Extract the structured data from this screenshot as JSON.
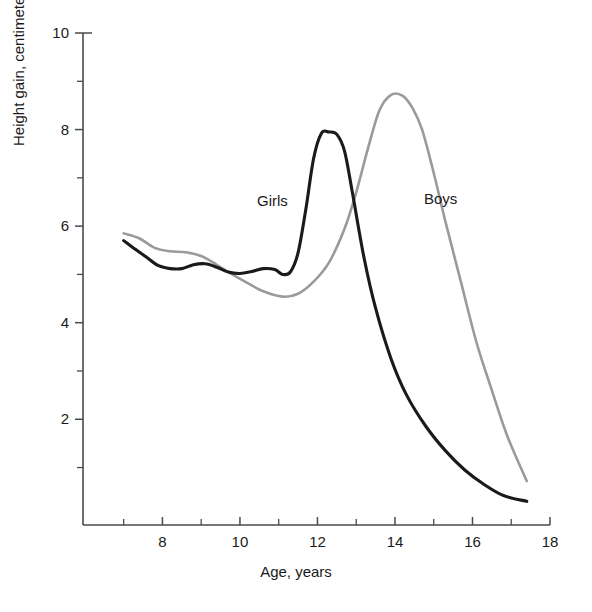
{
  "chart_data": {
    "type": "line",
    "title": "",
    "subtitle": "",
    "xlabel": "Age, years",
    "ylabel": "Height gain, centimeters per year",
    "xlim": [
      5.95,
      18.0
    ],
    "ylim": [
      -0.19,
      10.0
    ],
    "grid": false,
    "legend_position": "inline-annotation",
    "x_major_ticks": [
      8,
      10,
      12,
      14,
      16,
      18
    ],
    "x_minor_ticks": [
      7,
      9,
      11,
      13,
      15,
      17
    ],
    "x_tick_labels": [
      "8",
      "10",
      "12",
      "14",
      "16",
      "18"
    ],
    "y_major_ticks": [
      2,
      4,
      6,
      8,
      10
    ],
    "y_minor_ticks": [
      1,
      3,
      5,
      7,
      9
    ],
    "y_tick_labels": [
      "2",
      "4",
      "6",
      "8",
      "10"
    ],
    "annotations": [
      {
        "text": "Girls",
        "x": 12.5,
        "y": 6.6
      },
      {
        "text": "Boys",
        "x": 14.85,
        "y": 6.65
      }
    ],
    "series": [
      {
        "name": "Girls",
        "color": "#1a1a1a",
        "x": [
          7.0,
          7.3,
          7.6,
          7.9,
          8.2,
          8.5,
          8.8,
          9.1,
          9.4,
          9.7,
          10.0,
          10.3,
          10.6,
          10.9,
          11.1,
          11.3,
          11.5,
          11.7,
          11.9,
          12.1,
          12.3,
          12.5,
          12.7,
          12.9,
          13.2,
          13.5,
          13.9,
          14.3,
          14.8,
          15.3,
          15.8,
          16.3,
          16.8,
          17.4
        ],
        "y": [
          5.7,
          5.52,
          5.35,
          5.18,
          5.12,
          5.12,
          5.2,
          5.22,
          5.15,
          5.05,
          5.02,
          5.06,
          5.12,
          5.1,
          5.0,
          5.05,
          5.45,
          6.35,
          7.4,
          7.92,
          7.95,
          7.9,
          7.55,
          6.7,
          5.35,
          4.3,
          3.25,
          2.5,
          1.85,
          1.35,
          0.95,
          0.65,
          0.42,
          0.3
        ]
      },
      {
        "name": "Boys",
        "color": "#9a9a9a",
        "x": [
          7.0,
          7.4,
          7.8,
          8.2,
          8.6,
          9.0,
          9.4,
          9.8,
          10.2,
          10.6,
          11.1,
          11.5,
          11.9,
          12.3,
          12.7,
          13.0,
          13.3,
          13.6,
          13.9,
          14.2,
          14.45,
          14.7,
          15.0,
          15.3,
          15.7,
          16.1,
          16.5,
          16.9,
          17.4
        ],
        "y": [
          5.85,
          5.75,
          5.55,
          5.48,
          5.46,
          5.38,
          5.2,
          5.0,
          4.82,
          4.65,
          4.54,
          4.6,
          4.85,
          5.25,
          5.95,
          6.7,
          7.6,
          8.4,
          8.72,
          8.7,
          8.45,
          8.0,
          7.1,
          6.1,
          4.85,
          3.6,
          2.6,
          1.65,
          0.72
        ]
      }
    ]
  },
  "axes": {
    "x_axis_title": "Age, years",
    "y_axis_title": "Height gain, centimeters per year"
  },
  "labels": {
    "girls": "Girls",
    "boys": "Boys"
  },
  "colors": {
    "girls_line": "#1a1a1a",
    "boys_line": "#9a9a9a",
    "axis": "#4a4a4a",
    "background": "#ffffff"
  }
}
